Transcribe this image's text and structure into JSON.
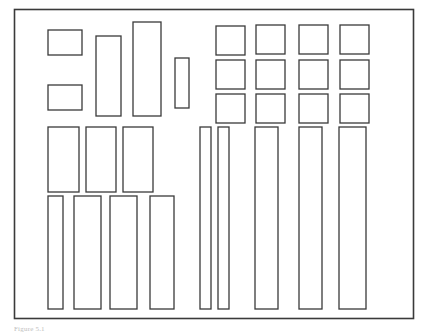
{
  "figure": {
    "caption": "Figure 5.1",
    "background_color": "#ffffff",
    "stroke_color": "#3a3a3a",
    "fill_color": "#ffffff",
    "stroke_width": 1.3,
    "canvas": {
      "width": 425,
      "height": 330
    }
  },
  "frame": {
    "label": "bounding-sheet",
    "x": 14.5,
    "y": 9.5,
    "width": 399,
    "height": 309,
    "stroke_width": 1.6
  },
  "chart_data": {
    "type": "diagram",
    "xlabel": "",
    "ylabel": "",
    "xlim": [
      14,
      414
    ],
    "ylim": [
      9,
      318
    ],
    "grid": false,
    "legend": "none",
    "container": {
      "x": 14.5,
      "y": 9.5,
      "width": 399,
      "height": 309
    },
    "item_count": 28,
    "groups": [
      {
        "name": "left-upper-small-stack",
        "count": 2
      },
      {
        "name": "left-upper-tall-set",
        "count": 3
      },
      {
        "name": "right-square-grid",
        "count": 12,
        "rows": 3,
        "cols": 4
      },
      {
        "name": "left-middle-row",
        "count": 3
      },
      {
        "name": "left-bottom-bars",
        "count": 4
      },
      {
        "name": "right-bottom-bars",
        "count": 5
      }
    ],
    "rectangles": [
      {
        "id": "r1",
        "group": "left-upper-small-stack",
        "x": 48,
        "y": 30,
        "width": 34,
        "height": 25
      },
      {
        "id": "r2",
        "group": "left-upper-small-stack",
        "x": 48,
        "y": 85,
        "width": 34,
        "height": 25
      },
      {
        "id": "r3",
        "group": "left-upper-tall-set",
        "x": 96,
        "y": 36,
        "width": 25,
        "height": 80
      },
      {
        "id": "r4",
        "group": "left-upper-tall-set",
        "x": 133,
        "y": 22,
        "width": 28,
        "height": 94
      },
      {
        "id": "r5",
        "group": "left-upper-tall-set",
        "x": 175,
        "y": 58,
        "width": 14,
        "height": 50
      },
      {
        "id": "g1",
        "group": "right-square-grid",
        "row": 1,
        "col": 1,
        "x": 216,
        "y": 26,
        "width": 29,
        "height": 29
      },
      {
        "id": "g2",
        "group": "right-square-grid",
        "row": 1,
        "col": 2,
        "x": 256,
        "y": 25,
        "width": 29,
        "height": 29
      },
      {
        "id": "g3",
        "group": "right-square-grid",
        "row": 1,
        "col": 3,
        "x": 299,
        "y": 25,
        "width": 29,
        "height": 29
      },
      {
        "id": "g4",
        "group": "right-square-grid",
        "row": 1,
        "col": 4,
        "x": 340,
        "y": 25,
        "width": 29,
        "height": 29
      },
      {
        "id": "g5",
        "group": "right-square-grid",
        "row": 2,
        "col": 1,
        "x": 216,
        "y": 60,
        "width": 29,
        "height": 29
      },
      {
        "id": "g6",
        "group": "right-square-grid",
        "row": 2,
        "col": 2,
        "x": 256,
        "y": 60,
        "width": 29,
        "height": 29
      },
      {
        "id": "g7",
        "group": "right-square-grid",
        "row": 2,
        "col": 3,
        "x": 299,
        "y": 60,
        "width": 29,
        "height": 29
      },
      {
        "id": "g8",
        "group": "right-square-grid",
        "row": 2,
        "col": 4,
        "x": 340,
        "y": 60,
        "width": 29,
        "height": 29
      },
      {
        "id": "g9",
        "group": "right-square-grid",
        "row": 3,
        "col": 1,
        "x": 216,
        "y": 94,
        "width": 29,
        "height": 29
      },
      {
        "id": "g10",
        "group": "right-square-grid",
        "row": 3,
        "col": 2,
        "x": 256,
        "y": 94,
        "width": 29,
        "height": 29
      },
      {
        "id": "g11",
        "group": "right-square-grid",
        "row": 3,
        "col": 3,
        "x": 299,
        "y": 94,
        "width": 29,
        "height": 29
      },
      {
        "id": "g12",
        "group": "right-square-grid",
        "row": 3,
        "col": 4,
        "x": 340,
        "y": 94,
        "width": 29,
        "height": 29
      },
      {
        "id": "m1",
        "group": "left-middle-row",
        "x": 48,
        "y": 127,
        "width": 31,
        "height": 65
      },
      {
        "id": "m2",
        "group": "left-middle-row",
        "x": 86,
        "y": 127,
        "width": 30,
        "height": 65
      },
      {
        "id": "m3",
        "group": "left-middle-row",
        "x": 123,
        "y": 127,
        "width": 30,
        "height": 65
      },
      {
        "id": "b1",
        "group": "left-bottom-bars",
        "x": 48,
        "y": 196,
        "width": 15,
        "height": 113
      },
      {
        "id": "b2",
        "group": "left-bottom-bars",
        "x": 74,
        "y": 196,
        "width": 27,
        "height": 113
      },
      {
        "id": "b3",
        "group": "left-bottom-bars",
        "x": 110,
        "y": 196,
        "width": 27,
        "height": 113
      },
      {
        "id": "b4",
        "group": "left-bottom-bars",
        "x": 150,
        "y": 196,
        "width": 24,
        "height": 113
      },
      {
        "id": "c1",
        "group": "right-bottom-bars",
        "x": 200,
        "y": 127,
        "width": 11,
        "height": 182
      },
      {
        "id": "c2",
        "group": "right-bottom-bars",
        "x": 218,
        "y": 127,
        "width": 11,
        "height": 182
      },
      {
        "id": "c3",
        "group": "right-bottom-bars",
        "x": 255,
        "y": 127,
        "width": 23,
        "height": 182
      },
      {
        "id": "c4",
        "group": "right-bottom-bars",
        "x": 299,
        "y": 127,
        "width": 23,
        "height": 182
      },
      {
        "id": "c5",
        "group": "right-bottom-bars",
        "x": 339,
        "y": 127,
        "width": 27,
        "height": 182
      }
    ]
  }
}
